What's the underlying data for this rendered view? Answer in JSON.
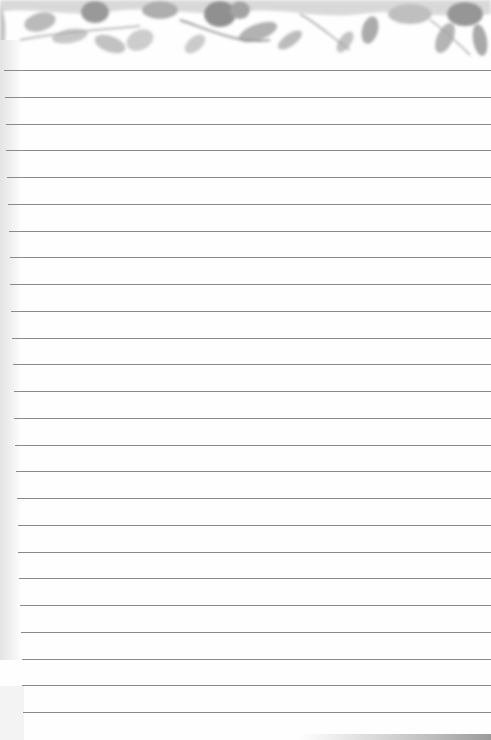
{
  "page": {
    "type": "lined-notepaper",
    "banner": {
      "motif": "watercolor-floral-foliage",
      "tone": "greyscale"
    },
    "ruled_lines": {
      "count": 25,
      "first_y": 70,
      "spacing": 26.75,
      "color": "#8a8a8a"
    },
    "colors": {
      "paper": "#fefefe",
      "leaf_dark": "#8c8c8c",
      "leaf_mid": "#a9a9a9",
      "leaf_light": "#cfcfcf"
    }
  }
}
